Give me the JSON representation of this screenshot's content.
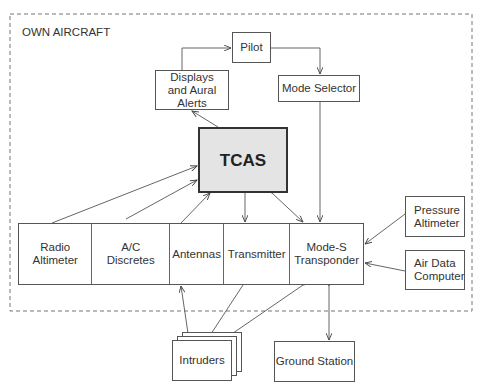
{
  "diagram": {
    "boundary_label": "OWN AIRCRAFT",
    "nodes": {
      "pilot": "Pilot",
      "displays": "Displays and Aural Alerts",
      "mode_selector": "Mode Selector",
      "tcas": "TCAS",
      "radio_altimeter": "Radio Altimeter",
      "ac_discretes": "A/C Discretes",
      "antennas": "Antennas",
      "transmitter": "Transmitter",
      "mode_s": "Mode-S Transponder",
      "pressure_altimeter": "Pressure Altimeter",
      "air_data_computer": "Air Data Computer",
      "intruders": "Intruders",
      "ground_station": "Ground Station"
    },
    "edges": [
      {
        "from": "Displays and Aural Alerts",
        "to": "Pilot"
      },
      {
        "from": "Pilot",
        "to": "Mode Selector"
      },
      {
        "from": "TCAS",
        "to": "Displays and Aural Alerts"
      },
      {
        "from": "Mode Selector",
        "to": "Mode-S Transponder"
      },
      {
        "from": "Radio Altimeter",
        "to": "TCAS"
      },
      {
        "from": "A/C Discretes",
        "to": "TCAS"
      },
      {
        "from": "Antennas",
        "to": "TCAS"
      },
      {
        "from": "TCAS",
        "to": "Transmitter"
      },
      {
        "from": "TCAS",
        "to": "Mode-S Transponder",
        "bidirectional": true
      },
      {
        "from": "Pressure Altimeter",
        "to": "Mode-S Transponder"
      },
      {
        "from": "Air Data Computer",
        "to": "Mode-S Transponder"
      },
      {
        "from": "Intruders",
        "to": "Antennas"
      },
      {
        "from": "Transmitter",
        "to": "Intruders"
      },
      {
        "from": "Mode-S Transponder",
        "to": "Intruders",
        "bidirectional": true
      },
      {
        "from": "Mode-S Transponder",
        "to": "Ground Station",
        "bidirectional": true
      }
    ]
  }
}
